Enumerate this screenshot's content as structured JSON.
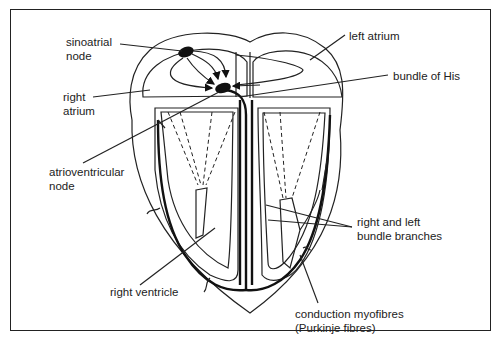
{
  "diagram": {
    "colors": {
      "ink": "#222222",
      "background": "#ffffff"
    },
    "labels": {
      "sinoatrial_node": [
        "sinoatrial",
        "node"
      ],
      "right_atrium": [
        "right",
        "atrium"
      ],
      "atrioventricular_node": [
        "atrioventricular",
        "node"
      ],
      "right_ventricle": [
        "right ventricle"
      ],
      "left_atrium": [
        "left atrium"
      ],
      "bundle_of_his": [
        "bundle of His"
      ],
      "bundle_branches": [
        "right and left",
        "bundle branches"
      ],
      "purkinje": [
        "conduction myofibres",
        "(Purkinje fibres)"
      ]
    }
  }
}
